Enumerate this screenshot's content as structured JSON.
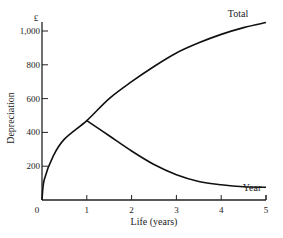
{
  "chart_data": {
    "type": "line",
    "title": "",
    "xlabel": "Life (years)",
    "ylabel": "Depreciation",
    "y_unit": "£",
    "xlim": [
      0,
      5
    ],
    "ylim": [
      0,
      1050
    ],
    "x_ticks": [
      0,
      1,
      2,
      3,
      4,
      5
    ],
    "y_ticks": [
      200,
      400,
      600,
      800,
      1000
    ],
    "y_tick_labels": [
      "200",
      "400",
      "600",
      "800",
      "1,000"
    ],
    "grid": false,
    "legend": "inline labels at line ends",
    "series": [
      {
        "name": "Total",
        "x": [
          0,
          0.05,
          0.25,
          0.5,
          1,
          1.5,
          2,
          2.5,
          3,
          3.5,
          4,
          4.5,
          5
        ],
        "values": [
          0,
          120,
          260,
          360,
          470,
          600,
          700,
          790,
          870,
          930,
          980,
          1020,
          1050
        ]
      },
      {
        "name": "Year",
        "x": [
          1,
          1.5,
          2,
          2.5,
          3,
          3.5,
          4,
          4.5,
          5
        ],
        "values": [
          470,
          380,
          290,
          210,
          150,
          110,
          90,
          78,
          75
        ]
      }
    ]
  },
  "labels": {
    "currency": "£",
    "xlabel": "Life (years)",
    "ylabel": "Depreciation",
    "total": "Total",
    "year": "Year"
  }
}
